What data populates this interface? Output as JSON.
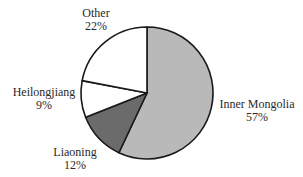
{
  "chart_data": {
    "type": "pie",
    "title": "",
    "start_angle_deg": 0,
    "direction": "clockwise",
    "slices": [
      {
        "label": "Inner Mongolia",
        "value": 57,
        "display": "57%",
        "color": "#b9b9b9"
      },
      {
        "label": "Liaoning",
        "value": 12,
        "display": "12%",
        "color": "#6b6b6b"
      },
      {
        "label": "Heilongjiang",
        "value": 9,
        "display": "9%",
        "color": "#ffffff"
      },
      {
        "label": "Other",
        "value": 22,
        "display": "22%",
        "color": "#ffffff"
      }
    ],
    "categories": [
      "Inner Mongolia",
      "Liaoning",
      "Heilongjiang",
      "Other"
    ],
    "values": [
      57,
      12,
      9,
      22
    ],
    "legend": "none (labels placed outside slices)"
  },
  "labels": {
    "inner_mongolia": {
      "name": "Inner Mongolia",
      "pct": "57%"
    },
    "liaoning": {
      "name": "Liaoning",
      "pct": "12%"
    },
    "heilongjiang": {
      "name": "Heilongjiang",
      "pct": "9%"
    },
    "other": {
      "name": "Other",
      "pct": "22%"
    }
  }
}
